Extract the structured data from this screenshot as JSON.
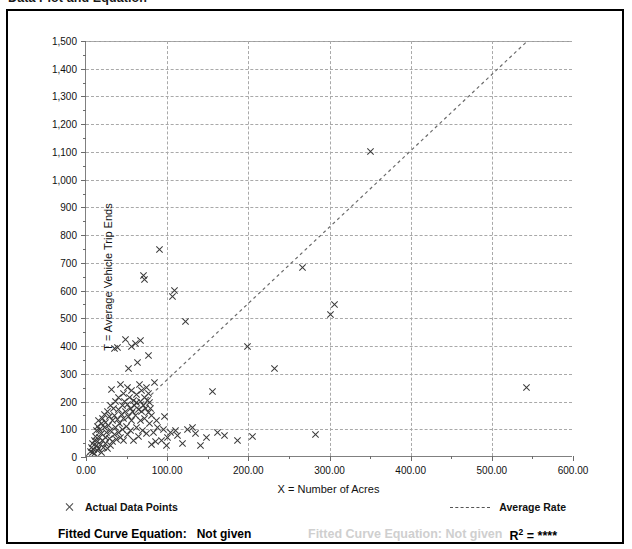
{
  "page": {
    "title": "Data Plot and Equation"
  },
  "chart_data": {
    "type": "scatter",
    "title": "Data Plot and Equation",
    "xlabel": "X = Number of Acres",
    "ylabel": "T = Average Vehicle Trip Ends",
    "xlim": [
      0,
      600
    ],
    "ylim": [
      0,
      1500
    ],
    "x_ticks": [
      0,
      100,
      200,
      300,
      400,
      500,
      600
    ],
    "x_tick_labels": [
      "0.00",
      "100.00",
      "200.00",
      "300.00",
      "400.00",
      "500.00",
      "600.00"
    ],
    "x_minor_step": 50,
    "y_ticks": [
      0,
      100,
      200,
      300,
      400,
      500,
      600,
      700,
      800,
      900,
      1000,
      1100,
      1200,
      1300,
      1400,
      1500
    ],
    "y_tick_labels": [
      "0",
      "100",
      "200",
      "300",
      "400",
      "500",
      "600",
      "700",
      "800",
      "900",
      "1,000",
      "1,100",
      "1,200",
      "1,300",
      "1,400",
      "1,500"
    ],
    "y_minor_step": 50,
    "grid": true,
    "legend_position": "below-axis",
    "marker": "x",
    "series": [
      {
        "name": "Actual Data Points",
        "marker": "x",
        "color": "#3a3a3a",
        "points": [
          [
            5,
            20
          ],
          [
            6,
            35
          ],
          [
            7,
            15
          ],
          [
            8,
            48
          ],
          [
            9,
            28
          ],
          [
            10,
            60
          ],
          [
            10,
            12
          ],
          [
            11,
            75
          ],
          [
            12,
            40
          ],
          [
            12,
            95
          ],
          [
            13,
            22
          ],
          [
            14,
            110
          ],
          [
            14,
            55
          ],
          [
            15,
            130
          ],
          [
            15,
            30
          ],
          [
            16,
            70
          ],
          [
            16,
            100
          ],
          [
            17,
            45
          ],
          [
            18,
            120
          ],
          [
            18,
            18
          ],
          [
            19,
            85
          ],
          [
            20,
            140
          ],
          [
            20,
            60
          ],
          [
            21,
            35
          ],
          [
            22,
            105
          ],
          [
            22,
            155
          ],
          [
            23,
            72
          ],
          [
            24,
            50
          ],
          [
            24,
            125
          ],
          [
            25,
            90
          ],
          [
            26,
            30
          ],
          [
            26,
            165
          ],
          [
            27,
            115
          ],
          [
            28,
            65
          ],
          [
            28,
            145
          ],
          [
            29,
            40
          ],
          [
            30,
            185
          ],
          [
            30,
            95
          ],
          [
            31,
            245
          ],
          [
            32,
            130
          ],
          [
            32,
            55
          ],
          [
            33,
            175
          ],
          [
            34,
            80
          ],
          [
            34,
            390
          ],
          [
            35,
            150
          ],
          [
            36,
            105
          ],
          [
            36,
            200
          ],
          [
            37,
            62
          ],
          [
            38,
            135
          ],
          [
            38,
            395
          ],
          [
            39,
            170
          ],
          [
            40,
            90
          ],
          [
            40,
            215
          ],
          [
            41,
            120
          ],
          [
            42,
            260
          ],
          [
            42,
            70
          ],
          [
            43,
            155
          ],
          [
            44,
            185
          ],
          [
            44,
            100
          ],
          [
            45,
            230
          ],
          [
            46,
            140
          ],
          [
            46,
            58
          ],
          [
            47,
            200
          ],
          [
            48,
            165
          ],
          [
            48,
            425
          ],
          [
            49,
            110
          ],
          [
            50,
            250
          ],
          [
            50,
            80
          ],
          [
            51,
            190
          ],
          [
            52,
            145
          ],
          [
            52,
            320
          ],
          [
            53,
            215
          ],
          [
            54,
            95
          ],
          [
            54,
            175
          ],
          [
            55,
            400
          ],
          [
            56,
            240
          ],
          [
            56,
            130
          ],
          [
            57,
            165
          ],
          [
            58,
            205
          ],
          [
            58,
            60
          ],
          [
            59,
            185
          ],
          [
            60,
            410
          ],
          [
            60,
            150
          ],
          [
            61,
            225
          ],
          [
            62,
            105
          ],
          [
            62,
            195
          ],
          [
            63,
            340
          ],
          [
            64,
            170
          ],
          [
            64,
            75
          ],
          [
            65,
            260
          ],
          [
            66,
            200
          ],
          [
            66,
            130
          ],
          [
            67,
            420
          ],
          [
            68,
            165
          ],
          [
            68,
            240
          ],
          [
            69,
            95
          ],
          [
            70,
            185
          ],
          [
            70,
            655
          ],
          [
            71,
            215
          ],
          [
            72,
            640
          ],
          [
            72,
            140
          ],
          [
            73,
            175
          ],
          [
            74,
            250
          ],
          [
            74,
            85
          ],
          [
            75,
            205
          ],
          [
            76,
            160
          ],
          [
            76,
            365
          ],
          [
            77,
            230
          ],
          [
            78,
            120
          ],
          [
            78,
            195
          ],
          [
            79,
            175
          ],
          [
            80,
            150
          ],
          [
            80,
            45
          ],
          [
            82,
            90
          ],
          [
            84,
            270
          ],
          [
            85,
            55
          ],
          [
            86,
            130
          ],
          [
            88,
            108
          ],
          [
            90,
            750
          ],
          [
            92,
            60
          ],
          [
            95,
            100
          ],
          [
            96,
            145
          ],
          [
            98,
            40
          ],
          [
            100,
            70
          ],
          [
            104,
            88
          ],
          [
            106,
            580
          ],
          [
            108,
            600
          ],
          [
            110,
            95
          ],
          [
            112,
            78
          ],
          [
            118,
            50
          ],
          [
            122,
            490
          ],
          [
            125,
            100
          ],
          [
            130,
            105
          ],
          [
            134,
            85
          ],
          [
            140,
            42
          ],
          [
            148,
            72
          ],
          [
            155,
            235
          ],
          [
            162,
            90
          ],
          [
            170,
            78
          ],
          [
            186,
            60
          ],
          [
            198,
            400
          ],
          [
            205,
            75
          ],
          [
            232,
            320
          ],
          [
            266,
            685
          ],
          [
            282,
            82
          ],
          [
            300,
            515
          ],
          [
            305,
            550
          ],
          [
            350,
            1100
          ],
          [
            542,
            250
          ]
        ]
      }
    ],
    "trend": {
      "name": "Average Rate",
      "style": "dashed",
      "color": "#6b6b6b",
      "x_start": 0,
      "y_start": 0,
      "x_end": 545,
      "y_end": 1500
    }
  },
  "legend": {
    "data_points_label": "Actual Data Points",
    "average_rate_label": "Average Rate",
    "data_points_marker": "x-marker-icon",
    "average_rate_marker": "dashed-line-icon"
  },
  "footer": {
    "fitted_curve_label": "Fitted Curve Equation:",
    "fitted_curve_value": "Not given",
    "r_squared_label": "R",
    "r_squared_exponent": "2",
    "r_squared_value": "= ****"
  },
  "ghost_text": {
    "line1": "Fitted Curve Equation: Not given"
  }
}
